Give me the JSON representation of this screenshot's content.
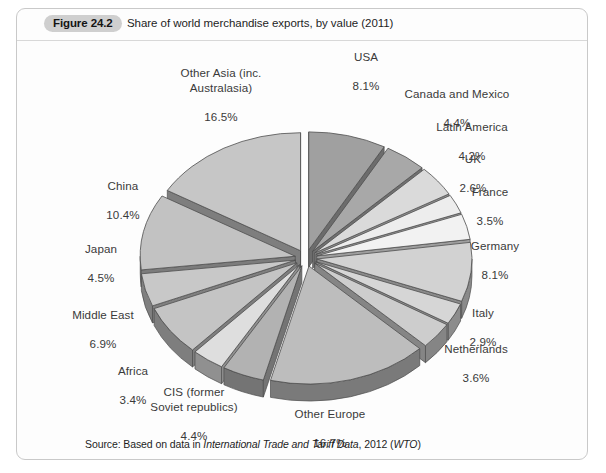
{
  "figure": {
    "badge": "Figure 24.2",
    "title": "Share of world merchandise exports, by value (2011)",
    "source_prefix": "Source: Based on data in ",
    "source_italic_1": "International Trade and Tariff Data",
    "source_mid": ", 2012 (",
    "source_italic_2": "WTO",
    "source_suffix": ")"
  },
  "chart_data": {
    "type": "pie",
    "title": "Share of world merchandise exports, by value (2011)",
    "style": "exploded 3D pie",
    "start_angle_deg": 0,
    "direction": "clockwise",
    "unit": "%",
    "legend": "none (direct slice labels)",
    "categories": [
      "USA",
      "Canada and Mexico",
      "Latin America",
      "UK",
      "France",
      "Germany",
      "Italy",
      "Netherlands",
      "Other Europe",
      "CIS (former Soviet republics)",
      "Africa",
      "Middle East",
      "Japan",
      "China",
      "Other Asia (inc. Australasia)"
    ],
    "values": [
      8.1,
      4.4,
      4.2,
      2.6,
      3.5,
      8.1,
      2.9,
      3.6,
      16.7,
      4.4,
      3.4,
      6.9,
      4.5,
      10.4,
      16.5
    ],
    "slices": [
      {
        "label": "USA",
        "value": 8.1,
        "value_text": "8.1%",
        "color": "#a0a0a0",
        "side_color": "#6c6c6c"
      },
      {
        "label": "Canada and Mexico",
        "value": 4.4,
        "value_text": "4.4%",
        "color": "#a8a8a8",
        "side_color": "#707070"
      },
      {
        "label": "Latin America",
        "value": 4.2,
        "value_text": "4.2%",
        "color": "#dadada",
        "side_color": "#8e8e8e"
      },
      {
        "label": "UK",
        "value": 2.6,
        "value_text": "2.6%",
        "color": "#ededed",
        "side_color": "#9a9a9a"
      },
      {
        "label": "France",
        "value": 3.5,
        "value_text": "3.5%",
        "color": "#f2f2f2",
        "side_color": "#9e9e9e"
      },
      {
        "label": "Germany",
        "value": 8.1,
        "value_text": "8.1%",
        "color": "#d2d2d2",
        "side_color": "#8a8a8a"
      },
      {
        "label": "Italy",
        "value": 2.9,
        "value_text": "2.9%",
        "color": "#d6d6d6",
        "side_color": "#8c8c8c"
      },
      {
        "label": "Netherlands",
        "value": 3.6,
        "value_text": "3.6%",
        "color": "#cdcdcd",
        "side_color": "#858585"
      },
      {
        "label": "Other Europe",
        "value": 16.7,
        "value_text": "16.7%",
        "color": "#bdbdbd",
        "side_color": "#7a7a7a"
      },
      {
        "label": "CIS (former Soviet republics)",
        "value": 4.4,
        "value_text": "4.4%",
        "color": "#b2b2b2",
        "side_color": "#747474"
      },
      {
        "label": "Africa",
        "value": 3.4,
        "value_text": "3.4%",
        "color": "#dedede",
        "side_color": "#909090"
      },
      {
        "label": "Middle East",
        "value": 6.9,
        "value_text": "6.9%",
        "color": "#c4c4c4",
        "side_color": "#7e7e7e"
      },
      {
        "label": "Japan",
        "value": 4.5,
        "value_text": "4.5%",
        "color": "#c8c8c8",
        "side_color": "#808080"
      },
      {
        "label": "China",
        "value": 10.4,
        "value_text": "10.4%",
        "color": "#c2c2c2",
        "side_color": "#7c7c7c"
      },
      {
        "label": "Other Asia (inc. Australasia)",
        "value": 16.5,
        "value_text": "16.5%",
        "color": "#c6c6c6",
        "side_color": "#7e7e7e"
      }
    ]
  },
  "labels": {
    "usa": {
      "name": "USA",
      "value": "8.1%"
    },
    "canada_mexico": {
      "name": "Canada and Mexico",
      "value": "4.4%"
    },
    "latin_america": {
      "name": "Latin America",
      "value": "4.2%"
    },
    "uk": {
      "name": "UK",
      "value": "2.6%"
    },
    "france": {
      "name": "France",
      "value": "3.5%"
    },
    "germany": {
      "name": "Germany",
      "value": "8.1%"
    },
    "italy": {
      "name": "Italy",
      "value": "2.9%"
    },
    "netherlands": {
      "name": "Netherlands",
      "value": "3.6%"
    },
    "other_europe": {
      "name": "Other Europe",
      "value": "16.7%"
    },
    "cis": {
      "name": "CIS (former\nSoviet republics)",
      "value": "4.4%"
    },
    "africa": {
      "name": "Africa",
      "value": "3.4%"
    },
    "middle_east": {
      "name": "Middle East",
      "value": "6.9%"
    },
    "japan": {
      "name": "Japan",
      "value": "4.5%"
    },
    "china": {
      "name": "China",
      "value": "10.4%"
    },
    "other_asia": {
      "name": "Other Asia (inc.\nAustralasia)",
      "value": "16.5%"
    }
  }
}
